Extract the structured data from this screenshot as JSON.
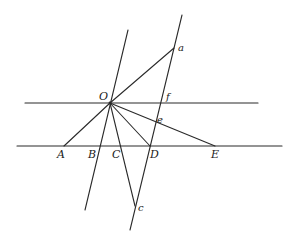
{
  "diagram": {
    "stroke_color": "#2a2a2a",
    "background": "#ffffff",
    "points": {
      "O": {
        "label": "O",
        "x": 110,
        "y": 103
      },
      "a": {
        "label": "a",
        "x": 174,
        "y": 48
      },
      "f": {
        "label": "f",
        "x": 163,
        "y": 103
      },
      "e": {
        "label": "e",
        "x": 157,
        "y": 120
      },
      "D": {
        "label": "D",
        "x": 150,
        "y": 146
      },
      "c": {
        "label": "c",
        "x": 135,
        "y": 206
      },
      "A": {
        "label": "A",
        "x": 64,
        "y": 146
      },
      "B": {
        "label": "B",
        "x": 98,
        "y": 146
      },
      "C": {
        "label": "C",
        "x": 120,
        "y": 146
      },
      "E": {
        "label": "E",
        "x": 215,
        "y": 146
      }
    },
    "lines": [
      {
        "name": "upper-horizontal-line",
        "x1": 25,
        "y1": 103,
        "x2": 258,
        "y2": 103
      },
      {
        "name": "lower-horizontal-line",
        "x1": 17,
        "y1": 146,
        "x2": 282,
        "y2": 146
      },
      {
        "name": "line-through-O-B",
        "x1": 128,
        "y1": 30,
        "x2": 85,
        "y2": 210
      },
      {
        "name": "transversal-a-f-e-D-c",
        "x1": 182,
        "y1": 15,
        "x2": 130,
        "y2": 230
      },
      {
        "name": "segment-O-a",
        "x1": 110,
        "y1": 103,
        "x2": 174,
        "y2": 48
      },
      {
        "name": "segment-O-A",
        "x1": 110,
        "y1": 103,
        "x2": 64,
        "y2": 146
      },
      {
        "name": "segment-O-c",
        "x1": 110,
        "y1": 103,
        "x2": 135,
        "y2": 206
      },
      {
        "name": "segment-O-D",
        "x1": 110,
        "y1": 103,
        "x2": 150,
        "y2": 146
      },
      {
        "name": "segment-O-E",
        "x1": 110,
        "y1": 103,
        "x2": 215,
        "y2": 146
      }
    ],
    "labels": [
      {
        "name": "label-O",
        "text": "O",
        "x": 99,
        "y": 100,
        "cls": "lbl-upper"
      },
      {
        "name": "label-a",
        "text": "a",
        "x": 178,
        "y": 51,
        "cls": "lbl-lower"
      },
      {
        "name": "label-f",
        "text": "f",
        "x": 166,
        "y": 100,
        "cls": "lbl-lower"
      },
      {
        "name": "label-e",
        "text": "e",
        "x": 157,
        "y": 123,
        "cls": "lbl-lower"
      },
      {
        "name": "label-A",
        "text": "A",
        "x": 57,
        "y": 158,
        "cls": "lbl-upper"
      },
      {
        "name": "label-B",
        "text": "B",
        "x": 88,
        "y": 158,
        "cls": "lbl-upper"
      },
      {
        "name": "label-C",
        "text": "C",
        "x": 112,
        "y": 158,
        "cls": "lbl-upper"
      },
      {
        "name": "label-D",
        "text": "D",
        "x": 150,
        "y": 158,
        "cls": "lbl-upper"
      },
      {
        "name": "label-E",
        "text": "E",
        "x": 211,
        "y": 158,
        "cls": "lbl-upper"
      },
      {
        "name": "label-c",
        "text": "c",
        "x": 138,
        "y": 211,
        "cls": "lbl-lower"
      }
    ]
  }
}
